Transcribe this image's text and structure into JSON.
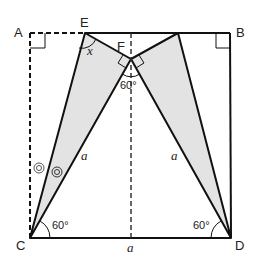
{
  "points": {
    "A": {
      "label": "A",
      "x": 30,
      "y": 33
    },
    "B": {
      "label": "B",
      "x": 230,
      "y": 33
    },
    "C": {
      "label": "C",
      "x": 30,
      "y": 238
    },
    "D": {
      "label": "D",
      "x": 231,
      "y": 238
    },
    "E": {
      "label": "E",
      "x": 85,
      "y": 33
    },
    "F": {
      "label": "F",
      "x": 131,
      "y": 59
    },
    "G": {
      "label": "",
      "x": 178,
      "y": 33
    }
  },
  "labels": {
    "angle_x": "x",
    "angle_F": "60°",
    "angle_C": "60°",
    "angle_D": "60°",
    "side_CF": "a",
    "side_DF": "a",
    "side_CD": "a"
  },
  "colors": {
    "stroke": "#111111",
    "fill": "#e3e3e3",
    "dash": "#111111"
  }
}
